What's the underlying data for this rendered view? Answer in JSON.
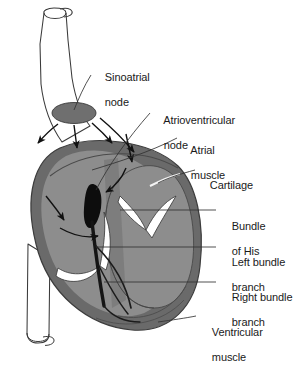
{
  "figure": {
    "type": "anatomical-diagram",
    "background_color": "#ffffff"
  },
  "palette": {
    "outline": "#3a3a3a",
    "vessel_fill": "#ffffff",
    "sa_node_fill": "#6f6f6f",
    "atrium_fill": "#8d8d8d",
    "ventricle_wall": "#6a6a6a",
    "ventricle_chamber": "#8d8d8d",
    "septum_fill": "#7a7a7a",
    "valve_cusp": "#ffffff",
    "conduction_black": "#0d0d0d",
    "label_text": "#1a1a1a",
    "leader_line": "#333333"
  },
  "labels": [
    {
      "id": "sinoatrial-node",
      "line1": "Sinoatrial",
      "line2": "node",
      "x": 93,
      "y": 58
    },
    {
      "id": "atrioventricular-node",
      "line1": "Atrioventricular",
      "line2": "node",
      "x": 152,
      "y": 101
    },
    {
      "id": "atrial-muscle",
      "line1": "Atrial",
      "line2": "muscle",
      "x": 179,
      "y": 131
    },
    {
      "id": "cartilage",
      "line1": "Cartilage",
      "line2": "",
      "x": 198,
      "y": 166
    },
    {
      "id": "bundle-of-his",
      "line1": "Bundle",
      "line2": "of His",
      "x": 220,
      "y": 207
    },
    {
      "id": "left-bundle-branch",
      "line1": "Left bundle",
      "line2": "branch",
      "x": 220,
      "y": 243
    },
    {
      "id": "right-bundle-branch",
      "line1": "Right bundle",
      "line2": "branch",
      "x": 220,
      "y": 278
    },
    {
      "id": "ventricular-muscle",
      "line1": "Ventricular",
      "line2": "muscle",
      "x": 200,
      "y": 313
    }
  ],
  "structures": {
    "superior_vena_cava": "superior-vena-cava-vessel",
    "inferior_vessel": "descending-vessel",
    "sa_node": "sinoatrial-node-ellipse",
    "av_node": "atrioventricular-node-teardrop",
    "bundle": "bundle-of-his-trunk",
    "left_branch": "left-bundle-branch-path",
    "right_branch": "right-bundle-branch-path",
    "valves": "atrioventricular-valve-cusps",
    "impulse_arrows": "atrial-impulse-arrows"
  }
}
